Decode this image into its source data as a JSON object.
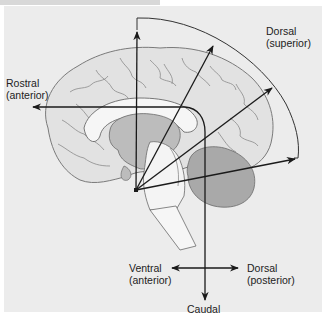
{
  "figure": {
    "type": "neuroanatomical orientation diagram"
  },
  "labels": {
    "dorsal_superior": {
      "line1": "Dorsal",
      "line2": "(superior)"
    },
    "rostral_anterior": {
      "line1": "Rostral",
      "line2": "(anterior)"
    },
    "ventral_anterior": {
      "line1": "Ventral",
      "line2": "(anterior)"
    },
    "dorsal_posterior": {
      "line1": "Dorsal",
      "line2": "(posterior)"
    },
    "caudal": "Caudal"
  },
  "colors": {
    "background": "#ececec",
    "cortex_fill": "#e2e2e2",
    "cortex_stroke": "#7a7a7a",
    "deep_fill": "#bcbcbc",
    "cerebellum_fill": "#a9a9a9",
    "brainstem_fill": "#f4f4f4",
    "arrow": "#1a1a1a"
  }
}
